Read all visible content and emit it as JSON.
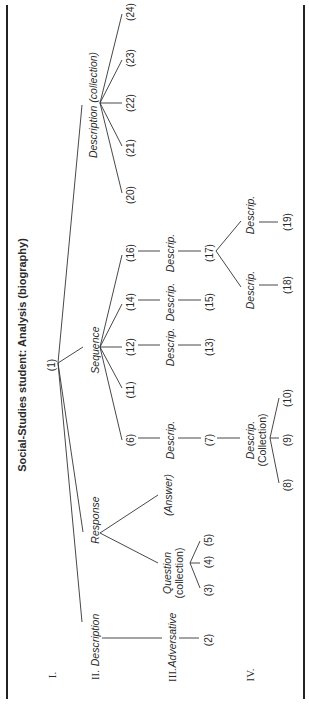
{
  "title": "Social-Studies student: Analysis (biography)",
  "levels": [
    "I.",
    "II.",
    "III.",
    "IV."
  ],
  "nodes": {
    "root": "(1)",
    "description_left": "Description",
    "response": "Response",
    "sequence": "Sequence",
    "description_collection": "Description (collection)",
    "adversative": "Adversative",
    "question_line1": "Question",
    "question_line2": "(collection)",
    "answer": "(Answer)",
    "descrip_6": "Descrip.",
    "descrip_12": "Descrip.",
    "descrip_14": "Descrip.",
    "descrip_16": "Descrip.",
    "descrip_coll_line1": "Descrip.",
    "descrip_coll_line2": "(Collection)",
    "descrip_18": "Descrip.",
    "descrip_19": "Descrip.",
    "n2": "(2)",
    "n3": "(3)",
    "n4": "(4)",
    "n5": "(5)",
    "n6": "(6)",
    "n7": "(7)",
    "n8": "(8)",
    "n9": "(9)",
    "n10": "(10)",
    "n11": "(11)",
    "n12": "(12)",
    "n13": "(13)",
    "n14": "(14)",
    "n15": "(15)",
    "n16": "(16)",
    "n17": "(17)",
    "n18": "(18)",
    "n19": "(19)",
    "n20": "(20)",
    "n21": "(21)",
    "n22": "(22)",
    "n23": "(23)",
    "n24": "(24)"
  }
}
